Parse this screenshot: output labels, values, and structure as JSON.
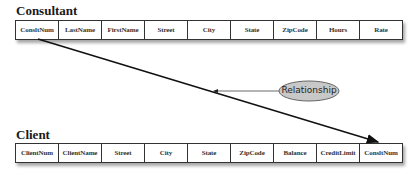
{
  "consultant": {
    "title": "Consultant",
    "columns": [
      "ConsltNum",
      "LastName",
      "FirstName",
      "Street",
      "City",
      "State",
      "ZipCode",
      "Hours",
      "Rate"
    ]
  },
  "client": {
    "title": "Client",
    "columns": [
      "ClientNum",
      "ClientName",
      "Street",
      "City",
      "State",
      "ZipCode",
      "Balance",
      "CreditLimit",
      "ConsltNum"
    ]
  },
  "relationship": {
    "label": "Relationship",
    "from": "Consultant.ConsltNum",
    "to": "Client.ConsltNum",
    "ellipse_fill": "#c8c8c8"
  }
}
